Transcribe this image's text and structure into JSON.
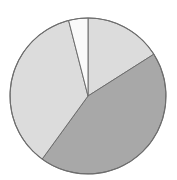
{
  "chart_data": {
    "type": "pie",
    "title": "",
    "xlabel": "",
    "ylabel": "",
    "legend_position": "none",
    "grid": false,
    "start_angle_deg": 0,
    "direction": "clockwise",
    "center": {
      "x": 88,
      "y": 96
    },
    "radius": 78,
    "outline_color": "#6e6e6e",
    "background": "#ffffff",
    "categories": [
      "Slice 1",
      "Slice 2",
      "Slice 3",
      "Slice 4"
    ],
    "values": [
      16,
      44,
      36,
      4
    ],
    "labels": [
      "",
      "",
      "",
      ""
    ],
    "colors": [
      "#dcdcdc",
      "#a8a8a8",
      "#dcdcdc",
      "#fafafa"
    ],
    "slices": [
      {
        "name": "Slice 1",
        "value": 16,
        "percent": 16,
        "start_angle_deg": 0,
        "end_angle_deg": 57.6,
        "color": "#dcdcdc",
        "label": ""
      },
      {
        "name": "Slice 2",
        "value": 44,
        "percent": 44,
        "start_angle_deg": 57.6,
        "end_angle_deg": 216.0,
        "color": "#a8a8a8",
        "label": ""
      },
      {
        "name": "Slice 3",
        "value": 36,
        "percent": 36,
        "start_angle_deg": 216.0,
        "end_angle_deg": 345.6,
        "color": "#dcdcdc",
        "label": ""
      },
      {
        "name": "Slice 4",
        "value": 4,
        "percent": 4,
        "start_angle_deg": 345.6,
        "end_angle_deg": 360.0,
        "color": "#fafafa",
        "label": ""
      }
    ]
  }
}
